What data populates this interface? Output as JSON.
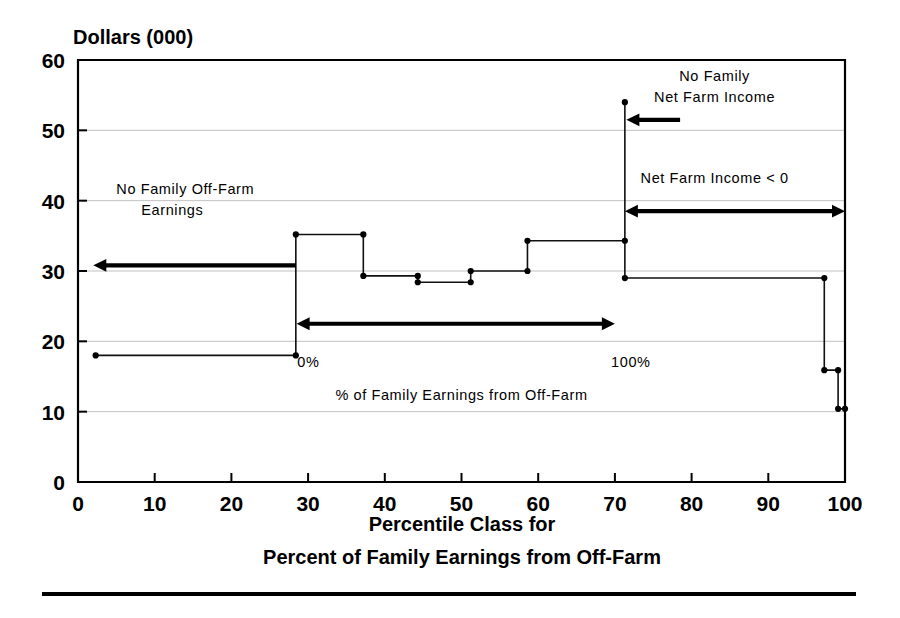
{
  "chart_data": {
    "type": "line",
    "subtype": "step",
    "title": "",
    "ytitle": "Dollars (000)",
    "xlabel": "Percentile Class for\nPercent of Family Earnings from Off-Farm",
    "xlabel_line1": "Percentile Class for",
    "xlabel_line2": "Percent of Family Earnings from Off-Farm",
    "ylabel": "Dollars (000)",
    "xlim": [
      0,
      100
    ],
    "ylim": [
      0,
      60
    ],
    "xticks": [
      0,
      10,
      20,
      30,
      40,
      50,
      60,
      70,
      80,
      90,
      100
    ],
    "yticks": [
      0,
      10,
      20,
      30,
      40,
      50,
      60
    ],
    "xticklabels": [
      "0",
      "10",
      "20",
      "30",
      "40",
      "50",
      "60",
      "70",
      "80",
      "90",
      "100"
    ],
    "yticklabels": [
      "0",
      "10",
      "20",
      "30",
      "40",
      "50",
      "60"
    ],
    "grid": "horizontal",
    "legend": "none",
    "series": [
      {
        "name": "Average household income by off-farm earnings percentile class",
        "points": [
          {
            "x": 2.3,
            "y": 18.0
          },
          {
            "x": 28.4,
            "y": 18.0
          },
          {
            "x": 28.4,
            "y": 35.2
          },
          {
            "x": 37.2,
            "y": 35.2
          },
          {
            "x": 37.2,
            "y": 29.3
          },
          {
            "x": 44.3,
            "y": 29.3
          },
          {
            "x": 44.3,
            "y": 28.4
          },
          {
            "x": 51.2,
            "y": 28.4
          },
          {
            "x": 51.2,
            "y": 30.0
          },
          {
            "x": 58.6,
            "y": 30.0
          },
          {
            "x": 58.6,
            "y": 34.3
          },
          {
            "x": 71.3,
            "y": 34.3
          },
          {
            "x": 71.3,
            "y": 54.0
          },
          {
            "x": 71.3,
            "y": 29.0
          },
          {
            "x": 97.3,
            "y": 29.0
          },
          {
            "x": 97.3,
            "y": 15.9
          },
          {
            "x": 99.1,
            "y": 15.9
          },
          {
            "x": 99.1,
            "y": 10.4
          },
          {
            "x": 100.0,
            "y": 10.4
          }
        ]
      }
    ],
    "annotations": [
      {
        "id": "no-family-off-farm-earnings",
        "line1": "No Family Off-Farm",
        "line2": "Earnings",
        "x": 5.0,
        "y": 41.0
      },
      {
        "id": "no-family-net-farm-income",
        "line1": "No Family",
        "line2": "Net Farm Income",
        "x": 83.0,
        "y": 57.0
      },
      {
        "id": "net-farm-income-negative",
        "line1": "Net Farm Income < 0",
        "line2": "",
        "x": 83.0,
        "y": 42.5
      },
      {
        "id": "pct-zero",
        "line1": "0%",
        "line2": "",
        "x": 28.6,
        "y": 16.3
      },
      {
        "id": "pct-hundred",
        "line1": "100%",
        "line2": "",
        "x": 69.5,
        "y": 16.3
      },
      {
        "id": "pct-family-earnings-off-farm",
        "line1": "% of Family Earnings from Off-Farm",
        "line2": "",
        "x": 50.0,
        "y": 11.6
      }
    ],
    "arrows": [
      {
        "id": "arrow-no-family-off-farm-earnings",
        "x1": 28.4,
        "x2": 2.0,
        "y": 30.8,
        "heads": "left"
      },
      {
        "id": "arrow-pct-range",
        "x1": 28.5,
        "x2": 70.0,
        "y": 22.5,
        "heads": "both"
      },
      {
        "id": "arrow-no-family-net-farm-income",
        "x1": 78.5,
        "x2": 71.5,
        "y": 51.5,
        "heads": "left"
      },
      {
        "id": "arrow-net-farm-income-negative",
        "x1": 71.3,
        "x2": 100.0,
        "y": 38.5,
        "heads": "both"
      }
    ]
  },
  "figure": {
    "footer_rule": true
  }
}
